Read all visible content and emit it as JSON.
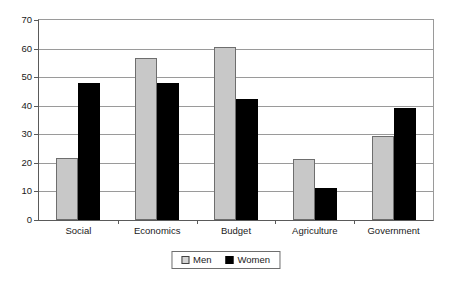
{
  "chart_data": {
    "type": "bar",
    "title": "",
    "subtitle": "",
    "xlabel": "",
    "ylabel": "",
    "categories": [
      "Social",
      "Economics",
      "Budget",
      "Agriculture",
      "Government"
    ],
    "series": [
      {
        "name": "Men",
        "color": "#c8c8c8",
        "values": [
          21.7,
          56.7,
          60.5,
          21.2,
          29.3
        ]
      },
      {
        "name": "Women",
        "color": "#000000",
        "values": [
          48.0,
          48.0,
          42.5,
          11.3,
          39.2
        ]
      }
    ],
    "ylim": [
      0,
      70
    ],
    "ytick_step": 10,
    "yticks": [
      "0",
      "10",
      "20",
      "30",
      "40",
      "50",
      "60",
      "70"
    ],
    "grid": "horizontal",
    "legend_position": "bottom",
    "legend_entries": [
      "Men",
      "Women"
    ]
  },
  "colors": {
    "men_fill": "#c8c8c8",
    "men_border": "#6e6e6e",
    "women_fill": "#000000",
    "axis": "#5a5a5a",
    "gridline": "#9a9a9a",
    "background": "#ffffff",
    "text": "#1a1a1a"
  }
}
